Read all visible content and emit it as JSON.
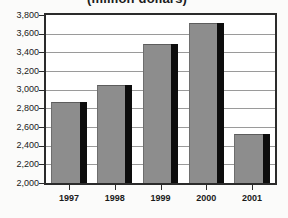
{
  "chart_data": {
    "type": "bar",
    "title": "(million dollars)",
    "xlabel": "",
    "ylabel": "",
    "categories": [
      "1997",
      "1998",
      "1999",
      "2000",
      "2001"
    ],
    "values": [
      2870,
      3050,
      3485,
      3710,
      2520
    ],
    "series": [
      {
        "name": "Value",
        "values": [
          2870,
          3050,
          3485,
          3710,
          2520
        ]
      }
    ],
    "ylim": [
      2000,
      3800
    ],
    "ytick_step": 200,
    "ytick_labels": [
      "3,800",
      "3,600",
      "3,400",
      "3,200",
      "3,000",
      "2,800",
      "2,600",
      "2,400",
      "2,200",
      "2,000"
    ],
    "ytick_values": [
      3800,
      3600,
      3400,
      3200,
      3000,
      2800,
      2600,
      2400,
      2200,
      2000
    ],
    "xtick_labels": [
      "1997",
      "1998",
      "1999",
      "2000",
      "2001"
    ],
    "grid": true,
    "grid_axis": "y",
    "legend": false,
    "legend_position": "none",
    "colors": {
      "bar_fill": "#8d8d8d",
      "bar_shadow": "#0d0d0d",
      "frame": "#2b2b2b",
      "gridline": "#9a9a9a",
      "text": "#1a1a1a",
      "plot_background": "#ffffff",
      "figure_background": "#fbfbfa"
    }
  }
}
